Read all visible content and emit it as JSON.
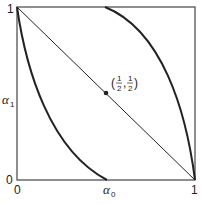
{
  "diagram": {
    "axes": {
      "x_label": "α",
      "x_label_sub": "0",
      "y_label": "α",
      "y_label_sub": "1",
      "x_ticks": [
        "0",
        "1"
      ],
      "y_ticks": [
        "0",
        "1"
      ]
    },
    "point": {
      "label_open": "(",
      "num1": "1",
      "den1": "2",
      "comma": ",",
      "num2": "1",
      "den2": "2",
      "label_close": ")",
      "x": 0.5,
      "y": 0.5
    },
    "curves": [
      {
        "name": "diagonal",
        "from": [
          0,
          1
        ],
        "to": [
          1,
          0
        ]
      },
      {
        "name": "lower-left-convex-curve",
        "from": [
          0,
          1
        ],
        "to": [
          0.5,
          0
        ]
      },
      {
        "name": "upper-right-concave-curve",
        "from": [
          0.5,
          1
        ],
        "to": [
          1,
          0
        ]
      }
    ],
    "colors": {
      "line": "#222222",
      "background": "#ffffff"
    }
  }
}
